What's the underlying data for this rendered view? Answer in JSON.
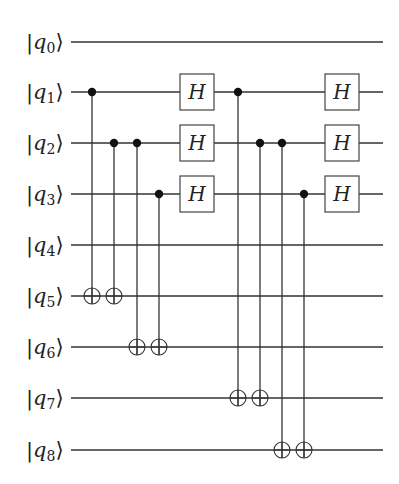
{
  "diagram": {
    "type": "quantum-circuit",
    "colors": {
      "wire": "#333333",
      "control": "#111111",
      "gate_border": "#444444",
      "background": "#ffffff"
    },
    "wire_start_x": 71,
    "wire_end_x": 383,
    "qubits": [
      {
        "name": "q",
        "index": "0",
        "y": 42
      },
      {
        "name": "q",
        "index": "1",
        "y": 92
      },
      {
        "name": "q",
        "index": "2",
        "y": 143
      },
      {
        "name": "q",
        "index": "3",
        "y": 194
      },
      {
        "name": "q",
        "index": "4",
        "y": 245
      },
      {
        "name": "q",
        "index": "5",
        "y": 296
      },
      {
        "name": "q",
        "index": "6",
        "y": 347
      },
      {
        "name": "q",
        "index": "7",
        "y": 398
      },
      {
        "name": "q",
        "index": "8",
        "y": 450
      }
    ],
    "cnots": [
      {
        "x": 92,
        "control": 1,
        "target": 5
      },
      {
        "x": 114,
        "control": 2,
        "target": 5
      },
      {
        "x": 137,
        "control": 2,
        "target": 6
      },
      {
        "x": 159,
        "control": 3,
        "target": 6
      },
      {
        "x": 238,
        "control": 1,
        "target": 7
      },
      {
        "x": 260,
        "control": 2,
        "target": 7
      },
      {
        "x": 282,
        "control": 2,
        "target": 8
      },
      {
        "x": 304,
        "control": 3,
        "target": 8
      }
    ],
    "gates": [
      {
        "label": "H",
        "qubit": 1,
        "x": 197
      },
      {
        "label": "H",
        "qubit": 2,
        "x": 197
      },
      {
        "label": "H",
        "qubit": 3,
        "x": 197
      },
      {
        "label": "H",
        "qubit": 1,
        "x": 342
      },
      {
        "label": "H",
        "qubit": 2,
        "x": 342
      },
      {
        "label": "H",
        "qubit": 3,
        "x": 342
      }
    ]
  }
}
